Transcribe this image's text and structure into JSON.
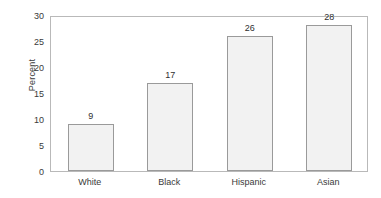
{
  "chart_data": {
    "type": "bar",
    "title": "",
    "subtitle": "",
    "xlabel": "",
    "ylabel": "Percent",
    "categories": [
      "White",
      "Black",
      "Hispanic",
      "Asian"
    ],
    "values": [
      9,
      17,
      26,
      28
    ],
    "value_labels": [
      "9",
      "17",
      "26",
      "28"
    ],
    "ylim": [
      0,
      30
    ],
    "y_ticks": [
      0,
      5,
      10,
      15,
      20,
      25,
      30
    ],
    "y_tick_labels": [
      "0",
      "5",
      "10",
      "15",
      "20",
      "25",
      "30"
    ],
    "grid": false,
    "legend": false,
    "legend_position": "none",
    "annotations": [],
    "colors": {
      "bar_fill": "#f2f2f2",
      "bar_border": "#9a9a9a",
      "frame": "#b9b9b9",
      "text": "#3a3a3a",
      "background": "#ffffff"
    }
  }
}
